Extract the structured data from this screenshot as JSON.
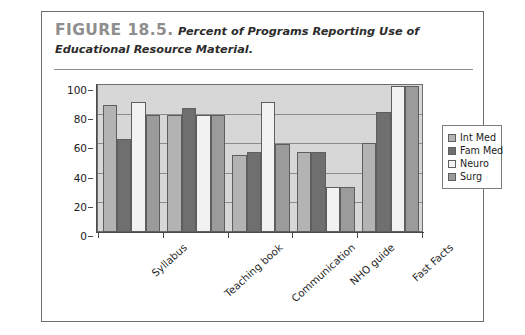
{
  "figure": {
    "number_label": "FIGURE 18.5.",
    "caption": "Percent of Programs Reporting Use of Educational Resource Material."
  },
  "chart_data": {
    "type": "bar",
    "title": "Percent of Programs Reporting Use of Educational Resource Material.",
    "xlabel": "",
    "ylabel": "",
    "ylim": [
      0,
      100
    ],
    "yticks": [
      0,
      20,
      40,
      60,
      80,
      100
    ],
    "grid": true,
    "legend_position": "right",
    "categories": [
      "Syllabus",
      "Teaching book",
      "Communication",
      "NHO guide",
      "Fast Facts"
    ],
    "series": [
      {
        "name": "Int Med",
        "color": "#b3b3b3",
        "values": [
          87,
          80,
          53,
          55,
          61
        ]
      },
      {
        "name": "Fam Med",
        "color": "#6f6f6f",
        "values": [
          64,
          85,
          55,
          55,
          82
        ]
      },
      {
        "name": "Neuro",
        "color": "#f2f2f2",
        "values": [
          89,
          80,
          89,
          31,
          100
        ]
      },
      {
        "name": "Surg",
        "color": "#9b9b9b",
        "values": [
          80,
          80,
          60,
          31,
          100
        ]
      }
    ],
    "plot_background": "#d7d7d7"
  }
}
